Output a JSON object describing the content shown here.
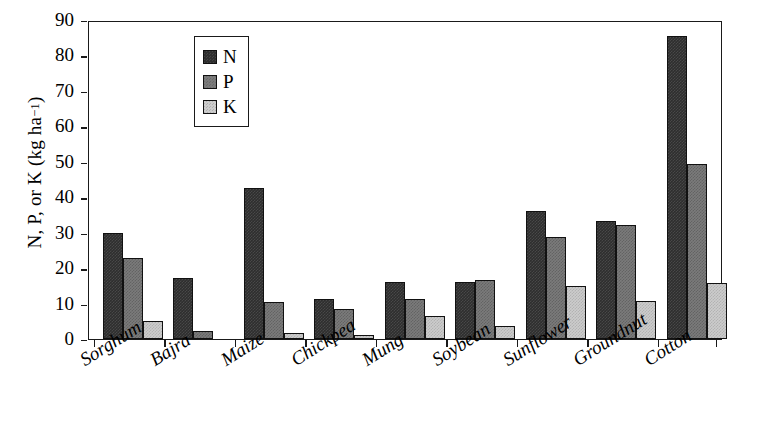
{
  "chart_data": {
    "type": "bar",
    "title": "",
    "xlabel": "",
    "ylabel": "N, P, or K (kg ha⁻¹)",
    "ylabel_parts": {
      "main": "N, P, or K (kg ha",
      "sup": "−1",
      "tail": ")"
    },
    "ylim": [
      0,
      90
    ],
    "yticks": [
      0,
      10,
      20,
      30,
      40,
      50,
      60,
      70,
      80,
      90
    ],
    "grid": false,
    "legend_position": "top-left-inside",
    "categories": [
      "Sorghum",
      "Bajra",
      "Maize",
      "Chickpea",
      "Mung",
      "Soybean",
      "Sunflower",
      "Groundnut",
      "Cotton"
    ],
    "series": [
      {
        "name": "N",
        "color": "#2e2e2e",
        "values": [
          30.0,
          17.3,
          42.5,
          11.2,
          16.1,
          16.2,
          36.0,
          33.2,
          85.5
        ]
      },
      {
        "name": "P",
        "color": "#7b7b7b",
        "values": [
          22.8,
          2.2,
          10.5,
          8.5,
          11.4,
          16.7,
          28.8,
          32.1,
          49.3
        ]
      },
      {
        "name": "K",
        "color": "#cccccc",
        "values": [
          5.2,
          0.0,
          1.8,
          1.2,
          6.5,
          3.6,
          15.0,
          10.6,
          15.8
        ]
      }
    ]
  },
  "legend": {
    "entries": [
      {
        "label": "N",
        "swatch": "dark-gray-swatch"
      },
      {
        "label": "P",
        "swatch": "medium-gray-swatch"
      },
      {
        "label": "K",
        "swatch": "light-gray-swatch"
      }
    ]
  }
}
